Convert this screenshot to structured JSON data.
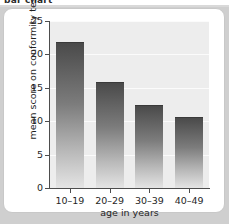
{
  "page": {
    "heading": "bar chart",
    "background_color": "#cfcfcf",
    "card_color": "#ffffff"
  },
  "chart_data": {
    "type": "bar",
    "title": "",
    "categories": [
      "10–19",
      "20–29",
      "30–39",
      "40–49"
    ],
    "values": [
      21.8,
      15.8,
      12.4,
      10.6
    ],
    "xlabel": "age in years",
    "ylabel": "mean score on conformity test",
    "ylim": [
      0,
      25
    ],
    "yticks": [
      0,
      5,
      10,
      15,
      20,
      25
    ],
    "ytick_labels": [
      "0",
      "5",
      "10",
      "15",
      "20",
      "25"
    ],
    "grid": true,
    "grid_color": "#fbfbfb",
    "legend": null,
    "plot_background": "#ededed",
    "bar_color_top": "#4a4a4a",
    "bar_color_bottom": "#e4e4e4"
  }
}
